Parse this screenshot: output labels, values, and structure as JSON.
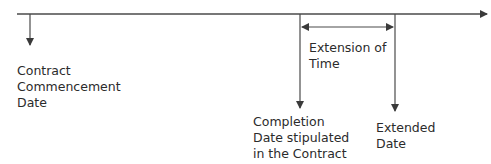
{
  "diagram": {
    "type": "timeline",
    "colors": {
      "line": "#4a4a4a",
      "text": "#2b2b2b",
      "background": "#ffffff"
    },
    "labels": {
      "commencement": "Contract\nCommencement\nDate",
      "extension": "Extension of\nTime",
      "completion": "Completion\nDate stipulated\nin the Contract",
      "extended": "Extended\nDate"
    },
    "markers": [
      {
        "id": "commencement",
        "x": 30
      },
      {
        "id": "completion",
        "x": 300
      },
      {
        "id": "extended",
        "x": 395
      }
    ]
  }
}
